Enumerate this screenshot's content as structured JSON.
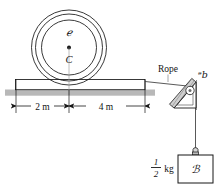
{
  "figure": {
    "labels": {
      "wheel_body": "ℯ",
      "wheel_center": "C",
      "rope": "Rope",
      "pulley": "ᵊb",
      "block": "ℬ",
      "mass_numerator": "1",
      "mass_denominator": "2",
      "mass_unit": "kg",
      "dim_left": "2 m",
      "dim_right": "4 m"
    },
    "colors": {
      "ink": "#161616",
      "ground_fill": "#b8b8b8",
      "plank_fill": "#ffffff",
      "hatch": "#8f8f8f",
      "paper": "#ffffff"
    },
    "dimensions": {
      "left_span_value": 2,
      "right_span_value": 4,
      "units": "m",
      "mass_value": 0.5,
      "mass_units": "kg"
    }
  }
}
